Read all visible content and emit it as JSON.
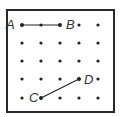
{
  "diagram": {
    "type": "dot-grid",
    "rows": 5,
    "cols": 5,
    "grid_x": [
      22,
      41,
      60,
      79,
      98
    ],
    "grid_y": [
      25,
      43,
      61,
      79,
      98
    ],
    "colors": {
      "border": "#2a2a2a",
      "dot": "#222222",
      "line": "#222222",
      "label": "#333333"
    },
    "points": [
      {
        "label": "A",
        "row": 0,
        "col": 0
      },
      {
        "label": "B",
        "row": 0,
        "col": 2
      },
      {
        "label": "C",
        "row": 4,
        "col": 1
      },
      {
        "label": "D",
        "row": 3,
        "col": 3
      }
    ],
    "segments": [
      {
        "name": "AB",
        "from": "A",
        "to": "B",
        "intermediate_dot": {
          "row": 0,
          "col": 1
        }
      },
      {
        "name": "CD",
        "from": "C",
        "to": "D"
      }
    ]
  }
}
